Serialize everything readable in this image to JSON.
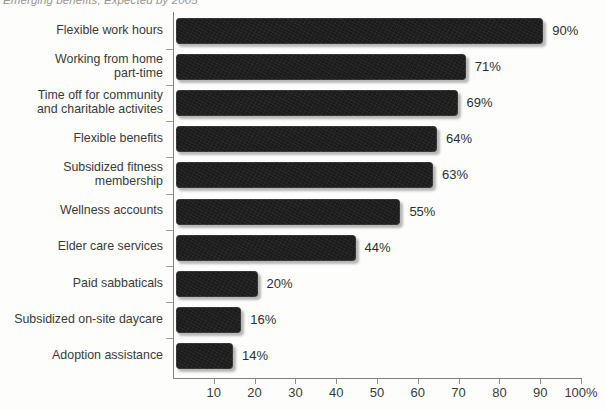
{
  "chart_data": {
    "type": "bar",
    "orientation": "horizontal",
    "title": "Emerging benefits, Expected by 2005",
    "xlabel": "",
    "ylabel": "",
    "xlim": [
      0,
      100
    ],
    "xticks": [
      10,
      20,
      30,
      40,
      50,
      60,
      70,
      80,
      90,
      100
    ],
    "xtick_labels": [
      "10",
      "20",
      "30",
      "40",
      "50",
      "60",
      "70",
      "80",
      "90",
      "100%"
    ],
    "grid": false,
    "legend": null,
    "bar_color": "#1b1b1b",
    "background_color": "#fdfdfb",
    "categories": [
      "Flexible work hours",
      "Working from home\npart-time",
      "Time off for community\nand charitable activites",
      "Flexible benefits",
      "Subsidized fitness\nmembership",
      "Wellness accounts",
      "Elder care services",
      "Paid sabbaticals",
      "Subsidized on-site daycare",
      "Adoption assistance"
    ],
    "values": [
      90,
      71,
      69,
      64,
      63,
      55,
      44,
      20,
      16,
      14
    ],
    "value_labels": [
      "90%",
      "71%",
      "69%",
      "64%",
      "63%",
      "55%",
      "44%",
      "20%",
      "16%",
      "14%"
    ]
  }
}
